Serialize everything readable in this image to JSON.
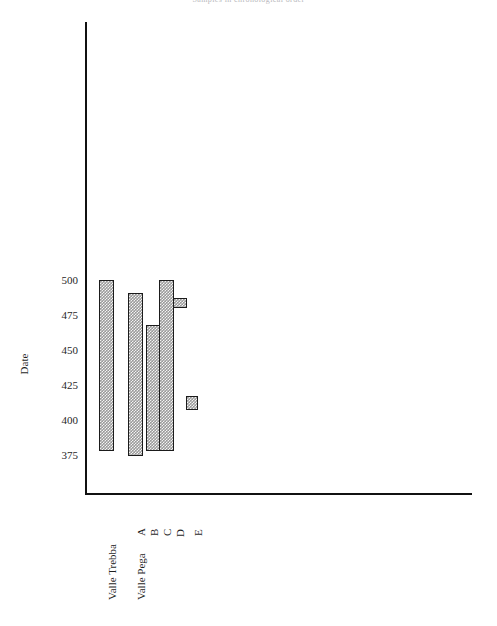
{
  "chart": {
    "title": "Samples in chronological order",
    "y_axis_title": "Date",
    "y_ticks": [
      "500",
      "475",
      "450",
      "425",
      "400",
      "375"
    ],
    "x_labels": [
      "Valle Trebba",
      "Valle Pega",
      "A",
      "B",
      "C",
      "D",
      "E"
    ]
  },
  "chart_data": {
    "type": "bar",
    "orientation": "vertical-range",
    "title": "Samples in chronological order",
    "xlabel": "",
    "ylabel": "Date",
    "ylim": [
      355,
      525
    ],
    "grid": false,
    "legend": null,
    "y_ticks": [
      500,
      475,
      450,
      425,
      400,
      375
    ],
    "categories": [
      "Valle Trebba",
      "Valle Pega",
      "A",
      "B",
      "C",
      "D",
      "E"
    ],
    "note": "Floating bars spanning a date range (high to low) for each group; Valle Trebba and Valle Pega are group headings spanning their sub-bars.",
    "series": [
      {
        "name": "date range",
        "bars": [
          {
            "category": "Valle Trebba",
            "high": 500,
            "low": 378
          },
          {
            "category": "A",
            "high": 491,
            "low": 374
          },
          {
            "category": "B",
            "high": 468,
            "low": 378
          },
          {
            "category": "C",
            "high": 500,
            "low": 378
          },
          {
            "category": "D",
            "high": 487,
            "low": 480
          },
          {
            "category": "E",
            "high": 417,
            "low": 407
          }
        ]
      }
    ]
  }
}
